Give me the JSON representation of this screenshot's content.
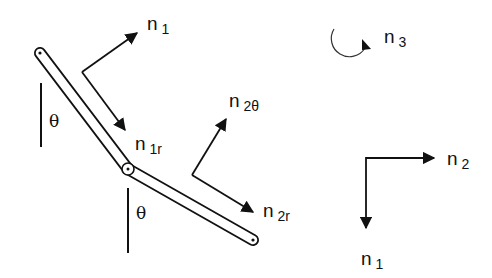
{
  "diagram": {
    "type": "double pendulum / two-link mechanism with unit vectors",
    "colors": {
      "ink": "#111111",
      "background": "#ffffff"
    },
    "links": [
      {
        "name": "link-1",
        "from": [
          40,
          53
        ],
        "to": [
          128,
          169
        ]
      },
      {
        "name": "link-2",
        "from": [
          128,
          169
        ],
        "to": [
          253,
          240
        ]
      }
    ],
    "angles": [
      {
        "name": "theta-1",
        "symbol": "θ"
      },
      {
        "name": "theta-2",
        "symbol": "θ"
      }
    ],
    "vectors": {
      "n1_upper": {
        "base": "n",
        "sub": "1"
      },
      "n1r": {
        "base": "n",
        "sub": "1r"
      },
      "n2theta": {
        "base": "n",
        "sub": "2θ"
      },
      "n2r": {
        "base": "n",
        "sub": "2r"
      },
      "n3": {
        "base": "n",
        "sub": "3"
      },
      "frame_n2": {
        "base": "n",
        "sub": "2"
      },
      "frame_n1": {
        "base": "n",
        "sub": "1"
      }
    }
  }
}
